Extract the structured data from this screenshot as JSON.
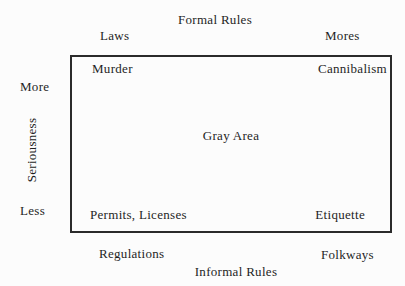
{
  "colors": {
    "background": "#fcfcfc",
    "text": "#1f1f1f",
    "box_border": "#2b2b2b"
  },
  "top": {
    "title": "Formal Rules",
    "left_label": "Laws",
    "right_label": "Mores"
  },
  "bottom": {
    "title": "Informal Rules",
    "left_label": "Regulations",
    "right_label": "Folkways"
  },
  "left_axis": {
    "label": "Seriousness",
    "top_value": "More",
    "bottom_value": "Less"
  },
  "box": {
    "top_left": "Murder",
    "top_right": "Cannibalism",
    "center": "Gray Area",
    "bottom_left": "Permits, Licenses",
    "bottom_right": "Etiquette"
  }
}
